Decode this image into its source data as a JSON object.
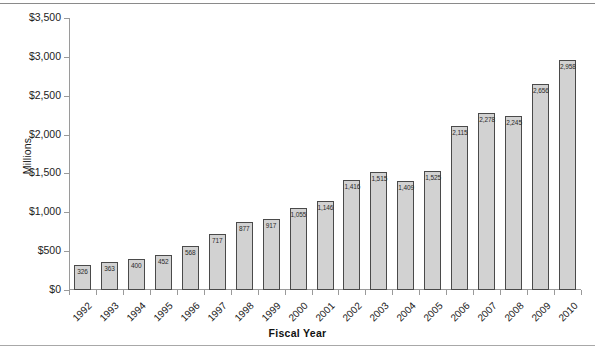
{
  "chart_data": {
    "type": "bar",
    "title": "",
    "xlabel": "Fiscal Year",
    "ylabel": "Millions",
    "categories": [
      "1992",
      "1993",
      "1994",
      "1995",
      "1996",
      "1997",
      "1998",
      "1999",
      "2000",
      "2001",
      "2002",
      "2003",
      "2004",
      "2005",
      "2006",
      "2007",
      "2008",
      "2009",
      "2010"
    ],
    "values": [
      326,
      363,
      400,
      452,
      568,
      717,
      877,
      917,
      1055,
      1146,
      1416,
      1515,
      1409,
      1525,
      2115,
      2278,
      2245,
      2656,
      2958
    ],
    "value_labels": [
      "326",
      "363",
      "400",
      "452",
      "568",
      "717",
      "877",
      "917",
      "1,055",
      "1,146",
      "1,416",
      "1,515",
      "1,409",
      "1,525",
      "2,115",
      "2,278",
      "2,245",
      "2,656",
      "2,958"
    ],
    "ylim": [
      0,
      3500
    ],
    "ytick_values": [
      0,
      500,
      1000,
      1500,
      2000,
      2500,
      3000,
      3500
    ],
    "ytick_labels": [
      "$0",
      "$500",
      "$1,000",
      "$1,500",
      "$2,000",
      "$2,500",
      "$3,000",
      "$3,500"
    ],
    "grid": false,
    "legend": null,
    "bar_color": "#d2d2d2",
    "bar_border_color": "#4a4a4a",
    "axis_color": "#9a9a9a"
  }
}
